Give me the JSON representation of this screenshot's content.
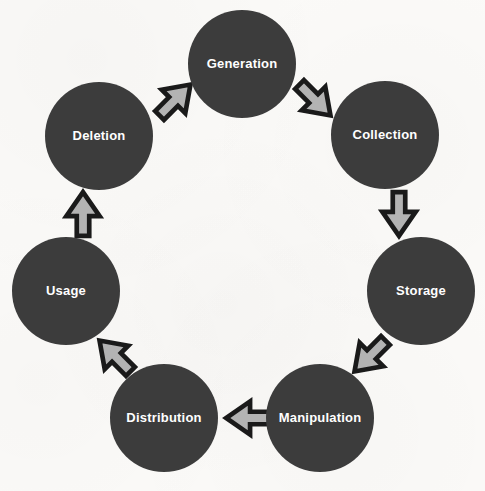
{
  "diagram": {
    "type": "cycle",
    "direction": "clockwise",
    "background_color": "#fbfaf8",
    "node_fill_color": "#3c3c3c",
    "node_text_color": "#ffffff",
    "arrow_fill_color": "#b3b3b3",
    "arrow_outline_color": "#1a1a1a",
    "nodes": [
      {
        "id": "generation",
        "label": "Generation",
        "cx": 242,
        "cy": 64,
        "r": 54
      },
      {
        "id": "collection",
        "label": "Collection",
        "cx": 385,
        "cy": 135,
        "r": 54
      },
      {
        "id": "storage",
        "label": "Storage",
        "cx": 421,
        "cy": 291,
        "r": 54
      },
      {
        "id": "manipulation",
        "label": "Manipulation",
        "cx": 320,
        "cy": 418,
        "r": 54
      },
      {
        "id": "distribution",
        "label": "Distribution",
        "cx": 164,
        "cy": 418,
        "r": 54
      },
      {
        "id": "usage",
        "label": "Usage",
        "cx": 66,
        "cy": 291,
        "r": 54
      },
      {
        "id": "deletion",
        "label": "Deletion",
        "cx": 99,
        "cy": 136,
        "r": 54
      }
    ],
    "arrows": [
      {
        "id": "deletion-to-generation",
        "from": "Deletion",
        "to": "Generation",
        "x": 149,
        "y": 74,
        "rotation": -45
      },
      {
        "id": "generation-to-collection",
        "from": "Generation",
        "to": "Collection",
        "x": 289,
        "y": 74,
        "rotation": 45
      },
      {
        "id": "collection-to-storage",
        "from": "Collection",
        "to": "Storage",
        "x": 373,
        "y": 188,
        "rotation": 90
      },
      {
        "id": "storage-to-manipulation",
        "from": "Storage",
        "to": "Manipulation",
        "x": 344,
        "y": 330,
        "rotation": 135
      },
      {
        "id": "manipulation-to-distribution",
        "from": "Manipulation",
        "to": "Distribution",
        "x": 222,
        "y": 392,
        "rotation": 180
      },
      {
        "id": "distribution-to-usage",
        "from": "Distribution",
        "to": "Usage",
        "x": 89,
        "y": 330,
        "rotation": 225
      },
      {
        "id": "usage-to-deletion",
        "from": "Usage",
        "to": "Deletion",
        "x": 57,
        "y": 188,
        "rotation": 270
      }
    ]
  }
}
